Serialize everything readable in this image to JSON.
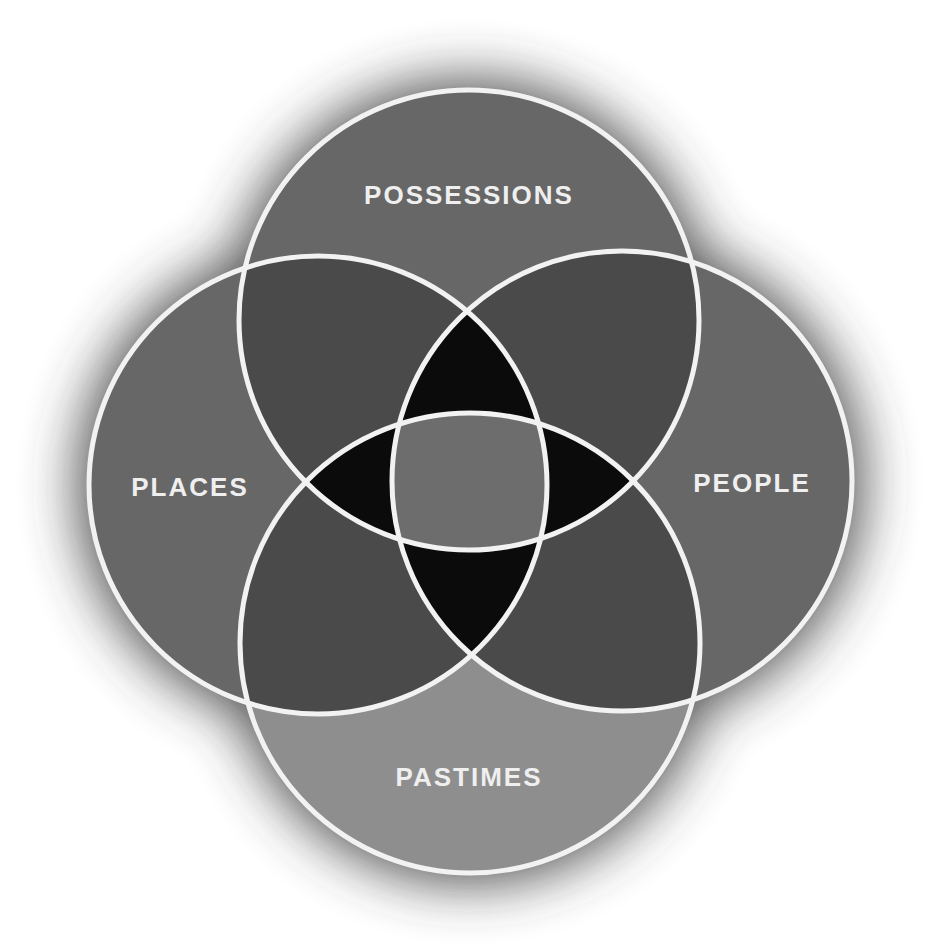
{
  "diagram": {
    "type": "venn",
    "sets": [
      {
        "id": "top",
        "label": "POSSESSIONS",
        "cx": 469,
        "cy": 320,
        "r": 230
      },
      {
        "id": "left",
        "label": "PLACES",
        "cx": 318,
        "cy": 485,
        "r": 229
      },
      {
        "id": "right",
        "label": "PEOPLE",
        "cx": 622,
        "cy": 481,
        "r": 230
      },
      {
        "id": "bottom",
        "label": "PASTIMES",
        "cx": 470,
        "cy": 643,
        "r": 230
      }
    ],
    "colors": {
      "background": "#ffffff",
      "glow": "#3a3a3a",
      "single": "#676767",
      "pastimes": "#8e8e8e",
      "double": "#4a4a4a",
      "triple": "#0b0b0b",
      "center": "#6d6d6d",
      "stroke": "#f2f2f2",
      "label": "#efefef"
    }
  }
}
